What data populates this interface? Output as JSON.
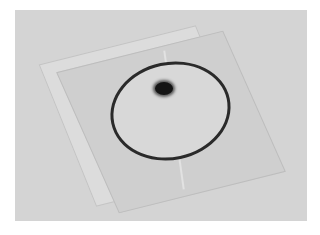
{
  "image": {
    "description": "Grayscale photograph of a transparent sleeve holding a circular disc with a dark spot near its top",
    "colors": {
      "background": "#d4d4d4",
      "sleeve": "#cfcfcf",
      "disc_ring": "#2a2a2a",
      "spot": "#141414"
    }
  }
}
